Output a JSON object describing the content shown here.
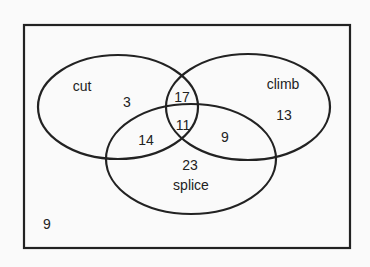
{
  "diagram": {
    "type": "venn",
    "sets": [
      {
        "name": "cut",
        "label": "cut"
      },
      {
        "name": "climb",
        "label": "climb"
      },
      {
        "name": "splice",
        "label": "splice"
      }
    ],
    "regions": {
      "cut_only": "3",
      "climb_only": "13",
      "splice_only": "23",
      "cut_climb_only": "17",
      "cut_splice_only": "14",
      "climb_splice_only": "9",
      "all_three": "11",
      "outside": "9"
    }
  }
}
